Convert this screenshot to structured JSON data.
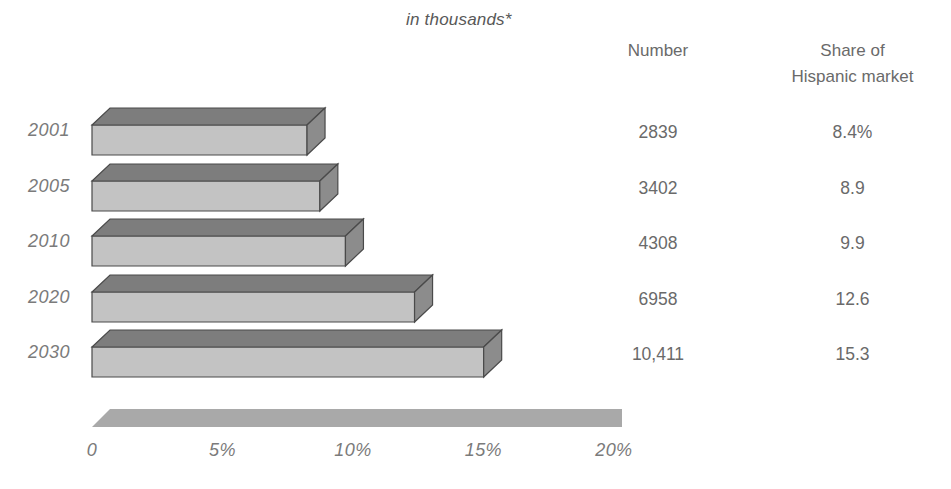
{
  "header": {
    "unit_note": "in thousands*",
    "column_number": "Number",
    "column_share_line1": "Share of",
    "column_share_line2": "Hispanic market"
  },
  "rows": [
    {
      "year": "2001",
      "number": "2839",
      "share": "8.4%",
      "share_value": 8.4
    },
    {
      "year": "2005",
      "number": "3402",
      "share": "8.9",
      "share_value": 8.9
    },
    {
      "year": "2010",
      "number": "4308",
      "share": "9.9",
      "share_value": 9.9
    },
    {
      "year": "2020",
      "number": "6958",
      "share": "12.6",
      "share_value": 12.6
    },
    {
      "year": "2030",
      "number": "10,411",
      "share": "15.3",
      "share_value": 15.3
    }
  ],
  "axis": {
    "ticks": [
      "0",
      "5%",
      "10%",
      "15%",
      "20%"
    ],
    "tick_values": [
      0,
      5,
      10,
      15,
      20
    ]
  },
  "colors": {
    "bar_front": "#c3c3c3",
    "bar_top": "#7d7d7d",
    "bar_side": "#8c8c8c",
    "bar_outline": "#4a4a4a",
    "axis_slab": "#a9a9a9",
    "text": "#6e6e6e"
  },
  "chart_data": {
    "type": "bar",
    "title": "in thousands*",
    "orientation": "horizontal",
    "categories": [
      "2001",
      "2005",
      "2010",
      "2020",
      "2030"
    ],
    "series": [
      {
        "name": "Share of Hispanic market",
        "values": [
          8.4,
          8.9,
          9.9,
          12.6,
          15.3
        ],
        "unit": "percent"
      },
      {
        "name": "Number (in thousands)",
        "values": [
          2839,
          3402,
          4308,
          6958,
          10411
        ],
        "unit": "thousands"
      }
    ],
    "xlabel": "",
    "ylabel": "",
    "xlim": [
      0,
      20
    ],
    "xticks": [
      0,
      5,
      10,
      15,
      20
    ],
    "xticklabels": [
      "0",
      "5%",
      "10%",
      "15%",
      "20%"
    ],
    "grid": false,
    "legend": false,
    "style": "3d-isometric-bars",
    "table_columns": [
      "Number",
      "Share of Hispanic market"
    ],
    "footnote_marker": "*"
  }
}
